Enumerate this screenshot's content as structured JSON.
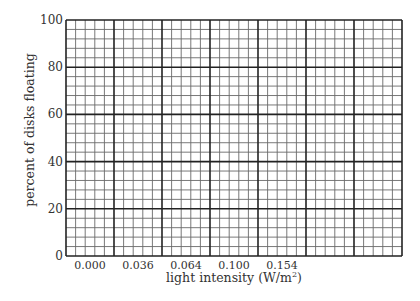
{
  "chart_data": {
    "type": "line",
    "title": "",
    "xlabel": "light intensity (W/m²)",
    "xlabel_main": "light intensity (W/m",
    "xlabel_sup": "2",
    "xlabel_end": ")",
    "ylabel": "percent of disks floating",
    "x_categories": [
      "0.000",
      "0.036",
      "0.064",
      "0.100",
      "0.154"
    ],
    "y_ticks": [
      "0",
      "20",
      "40",
      "60",
      "80",
      "100"
    ],
    "ylim": [
      0,
      100
    ],
    "grid": true,
    "grid_major_cols": 7,
    "grid_major_rows": 5,
    "grid_minor_per_major": 5,
    "series": [],
    "note": "Blank graph-paper grid for plotting; no data points drawn"
  },
  "colors": {
    "background": "#ffffff",
    "major_line": "#222222",
    "minor_line": "#6a6a6a",
    "text": "#333333"
  }
}
